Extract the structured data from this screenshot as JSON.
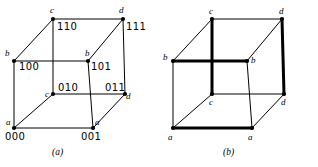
{
  "figure": {
    "background_color": "#ffffff",
    "ink_color": "#000000",
    "panels": [
      {
        "id": "a",
        "caption": "(a)",
        "caption_pos": {
          "x": 52,
          "y": 148
        },
        "description": "cube with binary 3-bit vertex codes",
        "vertices": [
          {
            "name": "front-bottom-left",
            "letter": "a",
            "code": "000",
            "x": 14,
            "y": 128,
            "letter_pos": {
              "x": 6,
              "y": 118
            },
            "code_pos": {
              "x": 5,
              "y": 132
            }
          },
          {
            "name": "front-bottom-right",
            "letter": "a",
            "code": "001",
            "x": 93,
            "y": 128,
            "letter_pos": {
              "x": 95,
              "y": 118
            },
            "code_pos": {
              "x": 81,
              "y": 132
            }
          },
          {
            "name": "front-top-left",
            "letter": "b",
            "code": "100",
            "x": 14,
            "y": 61,
            "letter_pos": {
              "x": 5,
              "y": 49
            },
            "code_pos": {
              "x": 19,
              "y": 62
            }
          },
          {
            "name": "front-top-right",
            "letter": "b",
            "code": "101",
            "x": 88,
            "y": 61,
            "letter_pos": {
              "x": 85,
              "y": 49
            },
            "code_pos": {
              "x": 91,
              "y": 62
            }
          },
          {
            "name": "back-bottom-left",
            "letter": "c",
            "code": "010",
            "x": 53,
            "y": 94,
            "letter_pos": {
              "x": 45,
              "y": 90
            },
            "code_pos": {
              "x": 58,
              "y": 83
            }
          },
          {
            "name": "back-bottom-right",
            "letter": "d",
            "code": "011",
            "x": 125,
            "y": 94,
            "letter_pos": {
              "x": 126,
              "y": 92
            },
            "code_pos": {
              "x": 105,
              "y": 83
            }
          },
          {
            "name": "back-top-left",
            "letter": "c",
            "code": "110",
            "x": 53,
            "y": 19,
            "letter_pos": {
              "x": 50,
              "y": 6
            },
            "code_pos": {
              "x": 57,
              "y": 22
            }
          },
          {
            "name": "back-top-right",
            "letter": "d",
            "code": "111",
            "x": 123,
            "y": 19,
            "letter_pos": {
              "x": 119,
              "y": 6
            },
            "code_pos": {
              "x": 126,
              "y": 22
            }
          }
        ],
        "edges": [
          {
            "from": "front-bottom-left",
            "to": "front-bottom-right",
            "weight": "thin"
          },
          {
            "from": "front-bottom-left",
            "to": "front-top-left",
            "weight": "thin"
          },
          {
            "from": "front-bottom-right",
            "to": "front-top-right",
            "weight": "thin"
          },
          {
            "from": "front-top-left",
            "to": "front-top-right",
            "weight": "thin"
          },
          {
            "from": "back-bottom-left",
            "to": "back-bottom-right",
            "weight": "thin"
          },
          {
            "from": "back-bottom-left",
            "to": "back-top-left",
            "weight": "thin"
          },
          {
            "from": "back-bottom-right",
            "to": "back-top-right",
            "weight": "thin"
          },
          {
            "from": "back-top-left",
            "to": "back-top-right",
            "weight": "thin"
          },
          {
            "from": "front-bottom-left",
            "to": "back-bottom-left",
            "weight": "thin"
          },
          {
            "from": "front-bottom-right",
            "to": "back-bottom-right",
            "weight": "thin"
          },
          {
            "from": "front-top-left",
            "to": "back-top-left",
            "weight": "thin"
          },
          {
            "from": "front-top-right",
            "to": "back-top-right",
            "weight": "thin"
          }
        ]
      },
      {
        "id": "b",
        "caption": "(b)",
        "caption_pos": {
          "x": 64,
          "y": 148
        },
        "description": "same cube with selected edges drawn bold",
        "vertices": [
          {
            "name": "front-bottom-left",
            "letter": "a",
            "x": 14,
            "y": 128,
            "letter_pos": {
              "x": 9,
              "y": 133
            }
          },
          {
            "name": "front-bottom-right",
            "letter": "a",
            "x": 93,
            "y": 128,
            "letter_pos": {
              "x": 89,
              "y": 133
            }
          },
          {
            "name": "front-top-left",
            "letter": "b",
            "x": 14,
            "y": 61,
            "letter_pos": {
              "x": 4,
              "y": 53
            }
          },
          {
            "name": "front-top-right",
            "letter": "b",
            "x": 88,
            "y": 61,
            "letter_pos": {
              "x": 92,
              "y": 56
            }
          },
          {
            "name": "back-bottom-left",
            "letter": "c",
            "x": 53,
            "y": 94,
            "letter_pos": {
              "x": 50,
              "y": 98
            }
          },
          {
            "name": "back-bottom-right",
            "letter": "d",
            "x": 125,
            "y": 94,
            "letter_pos": {
              "x": 122,
              "y": 98
            }
          },
          {
            "name": "back-top-left",
            "letter": "c",
            "x": 53,
            "y": 19,
            "letter_pos": {
              "x": 50,
              "y": 7
            }
          },
          {
            "name": "back-top-right",
            "letter": "d",
            "x": 123,
            "y": 19,
            "letter_pos": {
              "x": 120,
              "y": 7
            }
          }
        ],
        "edges": [
          {
            "from": "front-bottom-left",
            "to": "front-bottom-right",
            "weight": "bold"
          },
          {
            "from": "front-top-left",
            "to": "front-top-right",
            "weight": "bold"
          },
          {
            "from": "back-top-left",
            "to": "back-bottom-left",
            "weight": "bold"
          },
          {
            "from": "back-top-right",
            "to": "back-bottom-right",
            "weight": "bold"
          },
          {
            "from": "front-bottom-left",
            "to": "front-top-left",
            "weight": "thin"
          },
          {
            "from": "front-bottom-right",
            "to": "front-top-right",
            "weight": "thin"
          },
          {
            "from": "back-bottom-left",
            "to": "back-bottom-right",
            "weight": "thin"
          },
          {
            "from": "back-top-left",
            "to": "back-top-right",
            "weight": "thin"
          },
          {
            "from": "front-bottom-left",
            "to": "back-bottom-left",
            "weight": "thin"
          },
          {
            "from": "front-bottom-right",
            "to": "back-bottom-right",
            "weight": "thin"
          },
          {
            "from": "front-top-left",
            "to": "back-top-left",
            "weight": "thin"
          },
          {
            "from": "front-top-right",
            "to": "back-top-right",
            "weight": "thin"
          }
        ]
      }
    ]
  }
}
